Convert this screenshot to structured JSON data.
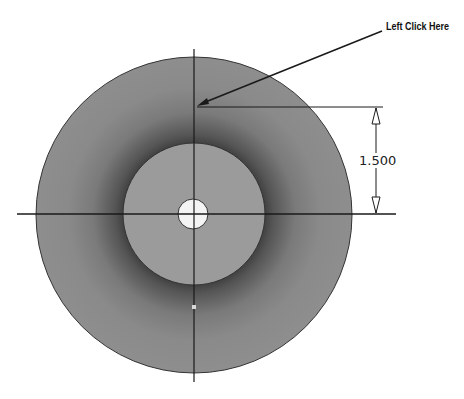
{
  "callout": {
    "label": "Left Click Here"
  },
  "dimension": {
    "value": "1.500"
  },
  "geometry": {
    "center": [
      194,
      214
    ],
    "outer_radius": 158,
    "inner_radius": 70,
    "hole_radius": 15
  },
  "colors": {
    "outer_ring": "#8c8c8c",
    "outer_ring_shadow": "#4a4a4a",
    "inner_disk": "#9b9b9b",
    "hole": "#f4f4f4",
    "line": "#1a1a1a"
  }
}
